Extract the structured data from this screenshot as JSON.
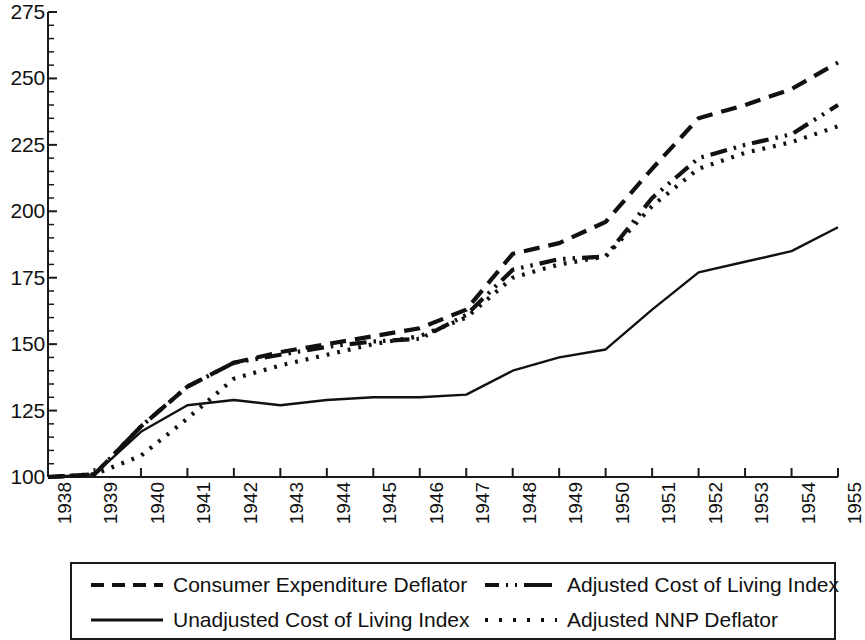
{
  "chart_data": {
    "type": "line",
    "title": "",
    "subtitle": "",
    "xlabel": "",
    "ylabel": "",
    "xlim": [
      1938,
      1955
    ],
    "ylim": [
      100,
      275
    ],
    "yticks": [
      100,
      125,
      150,
      175,
      200,
      225,
      250,
      275
    ],
    "ytick_labels": [
      "100",
      "125",
      "150",
      "175",
      "200",
      "225",
      "250",
      "275"
    ],
    "y_minor_ticks_per_interval": 5,
    "grid": false,
    "legend_position": "below-plot-boxed",
    "x": [
      1938,
      1939,
      1940,
      1941,
      1942,
      1943,
      1944,
      1945,
      1946,
      1947,
      1948,
      1949,
      1950,
      1951,
      1952,
      1953,
      1954,
      1955
    ],
    "xtick_labels": [
      "1938",
      "1939",
      "1940",
      "1941",
      "1942",
      "1943",
      "1944",
      "1945",
      "1946",
      "1947",
      "1948",
      "1949",
      "1950",
      "1951",
      "1952",
      "1953",
      "1954",
      "1955"
    ],
    "series": [
      {
        "name": "Consumer Expenditure Deflator",
        "style": "dashed",
        "color": "#111111",
        "values": [
          100,
          101,
          119,
          134,
          143,
          147,
          150,
          153,
          156,
          163,
          184,
          188,
          196,
          216,
          235,
          240,
          246,
          256
        ]
      },
      {
        "name": "Adjusted Cost of Living Index",
        "style": "dash-dot",
        "color": "#111111",
        "values": [
          100,
          101,
          119,
          134,
          143,
          146,
          149,
          151,
          152,
          161,
          178,
          182,
          183,
          205,
          220,
          225,
          229,
          240
        ]
      },
      {
        "name": "Unadjusted Cost of Living Index",
        "style": "solid",
        "color": "#111111",
        "values": [
          100,
          101,
          117,
          127,
          129,
          127,
          129,
          130,
          130,
          131,
          140,
          145,
          148,
          163,
          177,
          181,
          185,
          194
        ]
      },
      {
        "name": "Adjusted NNP Deflator",
        "style": "dotted",
        "color": "#111111",
        "values": [
          100,
          101,
          108,
          122,
          137,
          142,
          146,
          150,
          153,
          160,
          175,
          180,
          183,
          202,
          216,
          222,
          226,
          232
        ]
      }
    ]
  },
  "legend": {
    "entries": [
      {
        "label": "Consumer Expenditure Deflator",
        "style": "dashed"
      },
      {
        "label": "Adjusted Cost of Living Index",
        "style": "dash-dot"
      },
      {
        "label": "Unadjusted Cost of Living Index",
        "style": "solid"
      },
      {
        "label": "Adjusted NNP Deflator",
        "style": "dotted"
      }
    ]
  },
  "axes": {
    "axis_color": "#1a1a1a"
  }
}
